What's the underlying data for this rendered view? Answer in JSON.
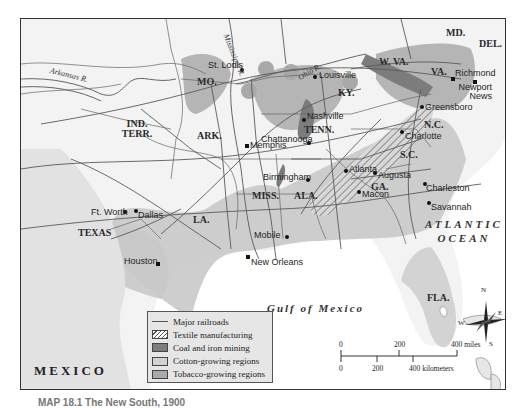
{
  "map": {
    "title": "The New South",
    "caption": "MAP 18.1  The New South, 1900",
    "colors": {
      "land": "#f3f3f3",
      "cotton": "#c9c9c9",
      "tobacco": "#a9a9a9",
      "coal_iron": "#7c7c7c",
      "water": "#ffffff",
      "railroad": "#5a5a5a"
    },
    "states": [
      {
        "label": "MO."
      },
      {
        "label": "IND. TERR."
      },
      {
        "label": "ARK."
      },
      {
        "label": "TEXAS"
      },
      {
        "label": "LA."
      },
      {
        "label": "MISS."
      },
      {
        "label": "ALA."
      },
      {
        "label": "TENN."
      },
      {
        "label": "KY."
      },
      {
        "label": "GA."
      },
      {
        "label": "S.C."
      },
      {
        "label": "N.C."
      },
      {
        "label": "VA."
      },
      {
        "label": "W. VA."
      },
      {
        "label": "MD."
      },
      {
        "label": "DEL."
      },
      {
        "label": "FLA."
      }
    ],
    "cities": [
      {
        "name": "St. Louis"
      },
      {
        "name": "Louisville"
      },
      {
        "name": "Richmond"
      },
      {
        "name": "Newport News"
      },
      {
        "name": "Greensboro"
      },
      {
        "name": "Nashville"
      },
      {
        "name": "Chattanooga"
      },
      {
        "name": "Charlotte"
      },
      {
        "name": "Memphis"
      },
      {
        "name": "Atlanta"
      },
      {
        "name": "Augusta"
      },
      {
        "name": "Birmingham"
      },
      {
        "name": "Charleston"
      },
      {
        "name": "Macon"
      },
      {
        "name": "Savannah"
      },
      {
        "name": "Ft. Worth"
      },
      {
        "name": "Dallas"
      },
      {
        "name": "Mobile"
      },
      {
        "name": "Houston"
      },
      {
        "name": "New Orleans"
      }
    ],
    "rivers": [
      {
        "name": "Mississippi R."
      },
      {
        "name": "Ohio R."
      },
      {
        "name": "Arkansas R."
      }
    ],
    "water_bodies": {
      "atlantic_line1": "ATLANTIC",
      "atlantic_line2": "OCEAN",
      "gulf": "Gulf of Mexico"
    },
    "country": "MEXICO",
    "compass": {
      "n": "N",
      "s": "S",
      "e": "E",
      "w": "W"
    }
  },
  "legend": {
    "items": [
      {
        "label": "Major railroads",
        "type": "line"
      },
      {
        "label": "Textile manufacturing",
        "type": "hatch"
      },
      {
        "label": "Coal and iron mining",
        "type": "coal"
      },
      {
        "label": "Cotton-growing regions",
        "type": "cotton"
      },
      {
        "label": "Tobacco-growing regions",
        "type": "tobacco"
      }
    ]
  },
  "scale": {
    "miles_0": "0",
    "miles_200": "200",
    "miles_400": "400 miles",
    "km_0": "0",
    "km_200": "200",
    "km_400": "400 kilometers"
  }
}
